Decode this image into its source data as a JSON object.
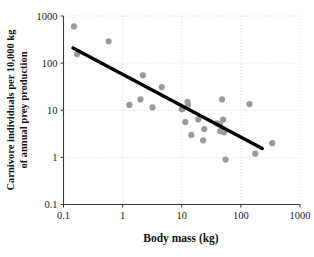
{
  "chart_data": {
    "type": "scatter",
    "title": "",
    "xlabel": "Body mass (kg)",
    "ylabel": "Carnivore individuals per 10,000 kg of annual prey production",
    "ylabel_line1": "Carnivore individuals per 10,000 kg",
    "ylabel_line2": "of annual prey production",
    "xscale": "log",
    "yscale": "log",
    "xlim": [
      0.1,
      1000
    ],
    "ylim": [
      0.1,
      1000
    ],
    "grid": true,
    "grid_style": "dotted",
    "legend": "none",
    "xticks": [
      "0.1",
      "1",
      "10",
      "100",
      "1000"
    ],
    "xtick_values": [
      0.1,
      1,
      10,
      100,
      1000
    ],
    "yticks": [
      "0.1",
      "1",
      "10",
      "100",
      "1000"
    ],
    "ytick_values": [
      0.1,
      1,
      10,
      100,
      1000
    ],
    "marker": {
      "shape": "circle",
      "color": "#9a9a9a",
      "radius_px": 3.1
    },
    "points": [
      {
        "x": 0.15,
        "y": 600
      },
      {
        "x": 0.17,
        "y": 155
      },
      {
        "x": 0.58,
        "y": 290
      },
      {
        "x": 1.3,
        "y": 13
      },
      {
        "x": 2.0,
        "y": 17
      },
      {
        "x": 2.2,
        "y": 55
      },
      {
        "x": 3.2,
        "y": 11.5
      },
      {
        "x": 4.6,
        "y": 31
      },
      {
        "x": 10.0,
        "y": 10.5
      },
      {
        "x": 10.5,
        "y": 10.8
      },
      {
        "x": 11.5,
        "y": 5.6
      },
      {
        "x": 12.5,
        "y": 15
      },
      {
        "x": 12.8,
        "y": 13
      },
      {
        "x": 14.5,
        "y": 3.0
      },
      {
        "x": 19.0,
        "y": 6.4
      },
      {
        "x": 23.0,
        "y": 2.3
      },
      {
        "x": 24.0,
        "y": 4.0
      },
      {
        "x": 39.0,
        "y": 5.3
      },
      {
        "x": 44.0,
        "y": 5.0
      },
      {
        "x": 45.0,
        "y": 3.6
      },
      {
        "x": 48.0,
        "y": 17
      },
      {
        "x": 50.0,
        "y": 6.3
      },
      {
        "x": 52.0,
        "y": 3.4
      },
      {
        "x": 55.0,
        "y": 0.9
      },
      {
        "x": 140.0,
        "y": 13.5
      },
      {
        "x": 175.0,
        "y": 1.2
      },
      {
        "x": 340.0,
        "y": 2.0
      }
    ],
    "trend_line": {
      "type": "linear-fit-loglog",
      "x_start": 0.145,
      "y_start": 210,
      "x_end": 230,
      "y_end": 1.55,
      "color": "#000000"
    }
  }
}
